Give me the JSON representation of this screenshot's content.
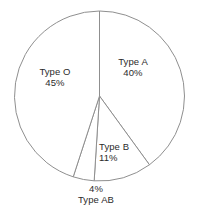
{
  "chart_data": {
    "type": "pie",
    "title": "",
    "subtitle": "",
    "xlabel": "",
    "ylabel": "",
    "legend_position": "none",
    "grid": false,
    "units": "%",
    "total": 100,
    "start_angle_deg": 0,
    "direction": "clockwise",
    "categories": [
      "Type A",
      "Type B",
      "Type AB",
      "Type O"
    ],
    "values": [
      40,
      11,
      4,
      45
    ],
    "slices": [
      {
        "label": "Type A",
        "value": 40,
        "value_text": "40%",
        "label_placement": "inside"
      },
      {
        "label": "Type B",
        "value": 11,
        "value_text": "11%",
        "label_placement": "inside"
      },
      {
        "label": "Type AB",
        "value": 4,
        "value_text": "4%",
        "label_placement": "outside-below"
      },
      {
        "label": "Type O",
        "value": 45,
        "value_text": "45%",
        "label_placement": "inside"
      }
    ]
  },
  "style": {
    "stroke_color": "#8f8f8f",
    "fill_color": "#ffffff",
    "text_color": "#2b2b2b",
    "background_color": "#ffffff"
  },
  "labels": {
    "type_a": {
      "name": "Type A",
      "pct": "40%"
    },
    "type_b": {
      "name": "Type B",
      "pct": "11%"
    },
    "type_ab": {
      "name": "Type AB",
      "pct": "4%"
    },
    "type_o": {
      "name": "Type O",
      "pct": "45%"
    }
  }
}
